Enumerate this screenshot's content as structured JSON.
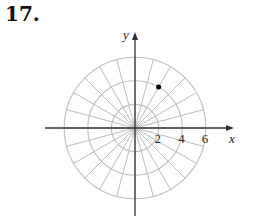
{
  "problem": {
    "number": "17."
  },
  "chart_data": {
    "type": "scatter",
    "coordinate_system": "polar",
    "title": "",
    "xlabel": "x",
    "ylabel": "y",
    "radial_ticks": [
      2,
      4,
      6
    ],
    "radial_tick_labels": [
      "2",
      "4",
      "6"
    ],
    "grid": {
      "circles": [
        2,
        4,
        6
      ],
      "radial_line_step_degrees": 15
    },
    "points": [
      {
        "r": 4,
        "theta_degrees": 60
      }
    ]
  },
  "colors": {
    "grid": "#bdbdbd",
    "axis": "#333333",
    "point": "#000000"
  }
}
